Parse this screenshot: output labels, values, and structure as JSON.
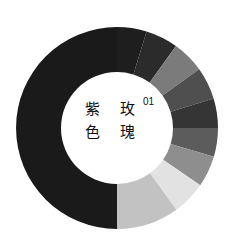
{
  "chart_data": {
    "type": "pie",
    "variant": "donut",
    "index_label": "01",
    "center": [
      117,
      128
    ],
    "outer_radius": 101,
    "inner_radius": 56,
    "start_angle_deg": 0,
    "direction": "clockwise",
    "segments": [
      {
        "label": "segment-1",
        "start_deg": 0,
        "end_deg": 17,
        "color": "#1e1e1e"
      },
      {
        "label": "segment-2",
        "start_deg": 17,
        "end_deg": 35.7,
        "color": "#2b2b2b"
      },
      {
        "label": "segment-3",
        "start_deg": 35.7,
        "end_deg": 54.5,
        "color": "#7b7b7b"
      },
      {
        "label": "segment-4",
        "start_deg": 54.5,
        "end_deg": 73,
        "color": "#4f4f4f"
      },
      {
        "label": "segment-5",
        "start_deg": 73,
        "end_deg": 90,
        "color": "#353535"
      },
      {
        "label": "segment-6",
        "start_deg": 90,
        "end_deg": 106.5,
        "color": "#5c5c5c"
      },
      {
        "label": "segment-7",
        "start_deg": 106.5,
        "end_deg": 124.5,
        "color": "#8e8e8e"
      },
      {
        "label": "segment-8",
        "start_deg": 124.5,
        "end_deg": 144,
        "color": "#e2e2e2"
      },
      {
        "label": "segment-9",
        "start_deg": 144,
        "end_deg": 180,
        "color": "#c2c2c2"
      },
      {
        "label": "segment-10",
        "start_deg": 180,
        "end_deg": 360,
        "color": "#1a1a1a"
      }
    ],
    "values_percent": [
      4.7,
      5.2,
      5.2,
      5.1,
      4.7,
      4.6,
      5.0,
      5.4,
      10.0,
      50.0
    ]
  },
  "center_text": {
    "row1_left": "紫",
    "row1_right": "玫",
    "row2_left": "色",
    "row2_right": "瑰",
    "superscript": "01"
  }
}
